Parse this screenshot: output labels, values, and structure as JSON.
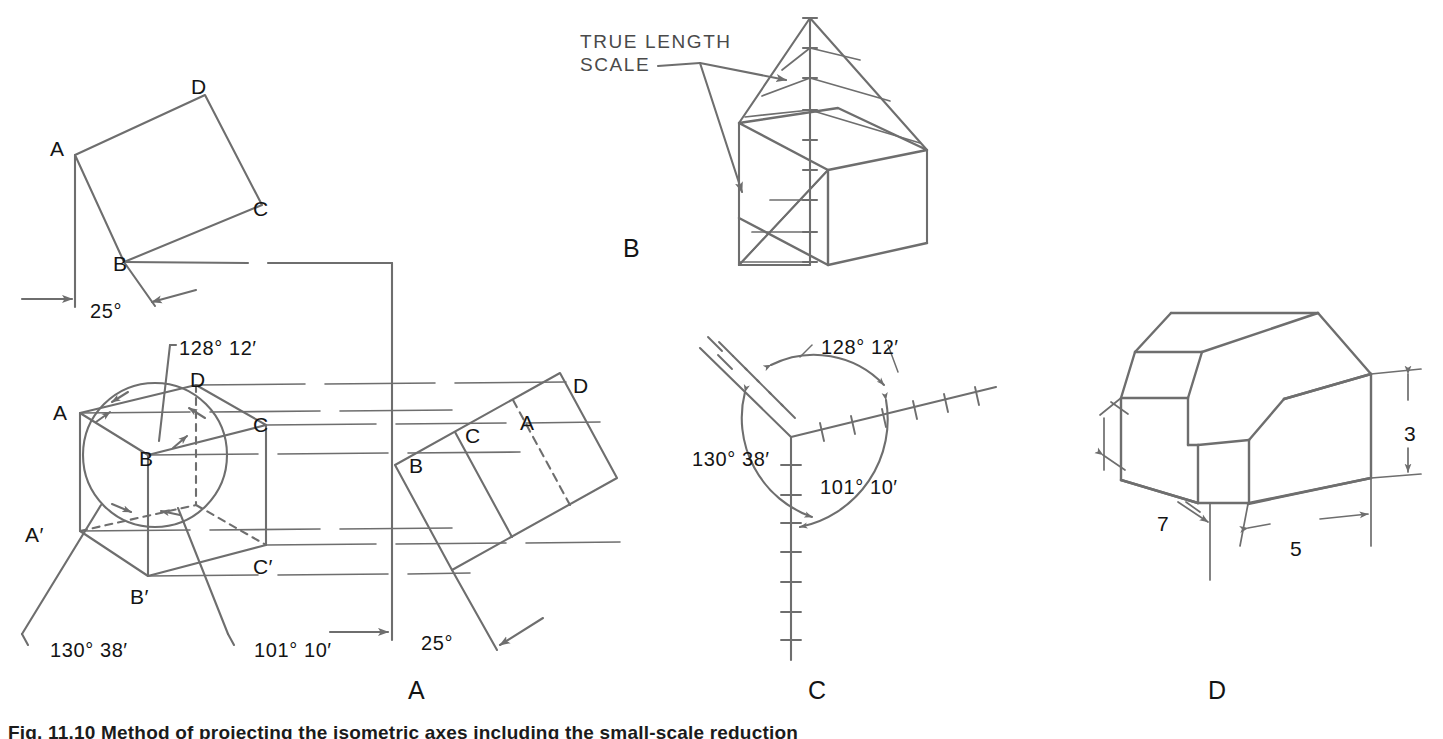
{
  "figure": {
    "caption": "Fig. 11.10  Method of projecting the isometric axes including the small-scale reduction",
    "panel_labels": [
      {
        "id": "panel-a",
        "text": "A",
        "x": 408,
        "y": 678
      },
      {
        "id": "panel-b",
        "text": "B",
        "x": 623,
        "y": 236
      },
      {
        "id": "panel-c",
        "text": "C",
        "x": 808,
        "y": 678
      },
      {
        "id": "panel-d",
        "text": "D",
        "x": 1208,
        "y": 678
      }
    ]
  },
  "panel_a": {
    "top_view": {
      "vertex_labels": [
        {
          "id": "vertex-a",
          "text": "A",
          "x": 50,
          "y": 138
        },
        {
          "id": "vertex-b",
          "text": "B",
          "x": 113,
          "y": 253
        },
        {
          "id": "vertex-c",
          "text": "C",
          "x": 253,
          "y": 198
        },
        {
          "id": "vertex-d",
          "text": "D",
          "x": 191,
          "y": 76
        }
      ],
      "angle_label": {
        "text": "25°",
        "x": 90,
        "y": 301
      }
    },
    "cube_view": {
      "vertex_labels": [
        {
          "id": "vertex-a",
          "text": "A",
          "x": 53,
          "y": 402
        },
        {
          "id": "vertex-b",
          "text": "B",
          "x": 139,
          "y": 448
        },
        {
          "id": "vertex-c",
          "text": "C",
          "x": 253,
          "y": 414
        },
        {
          "id": "vertex-d",
          "text": "D",
          "x": 190,
          "y": 369
        },
        {
          "id": "vertex-a-prime",
          "text": "A′",
          "x": 25,
          "y": 524
        },
        {
          "id": "vertex-b-prime",
          "text": "B′",
          "x": 130,
          "y": 586
        },
        {
          "id": "vertex-c-prime",
          "text": "C′",
          "x": 253,
          "y": 556
        }
      ],
      "angle_labels": [
        {
          "id": "angle-128-12",
          "text": "128° 12′",
          "x": 179,
          "y": 338
        },
        {
          "id": "angle-130-38",
          "text": "130° 38′",
          "x": 50,
          "y": 640
        },
        {
          "id": "angle-101-10",
          "text": "101° 10′",
          "x": 254,
          "y": 640
        }
      ]
    },
    "auxiliary_view": {
      "vertex_labels": [
        {
          "id": "vertex-b",
          "text": "B",
          "x": 409,
          "y": 455
        },
        {
          "id": "vertex-c",
          "text": "C",
          "x": 465,
          "y": 425
        },
        {
          "id": "vertex-a",
          "text": "A",
          "x": 520,
          "y": 412
        },
        {
          "id": "vertex-d",
          "text": "D",
          "x": 573,
          "y": 375
        }
      ],
      "angle_label": {
        "text": "25°",
        "x": 421,
        "y": 633
      }
    }
  },
  "panel_b": {
    "annotation": {
      "line1": "TRUE LENGTH",
      "line2": "SCALE"
    }
  },
  "panel_c": {
    "angle_labels": [
      {
        "id": "angle-128-12",
        "text": "128° 12′",
        "x": 821,
        "y": 337
      },
      {
        "id": "angle-130-38",
        "text": "130° 38′",
        "x": 692,
        "y": 449
      },
      {
        "id": "angle-101-10",
        "text": "101° 10′",
        "x": 820,
        "y": 477
      }
    ]
  },
  "panel_d": {
    "dimension_labels": [
      {
        "id": "dim-height-3",
        "text": "3",
        "x": 1404,
        "y": 423
      },
      {
        "id": "dim-depth-7",
        "text": "7",
        "x": 1157,
        "y": 513
      },
      {
        "id": "dim-width-5",
        "text": "5",
        "x": 1290,
        "y": 538
      }
    ]
  },
  "style": {
    "line_color": "#6e6e6e",
    "dark_line_color": "#5b5b5b",
    "text_color": "#141414",
    "background": "#ffffff"
  }
}
